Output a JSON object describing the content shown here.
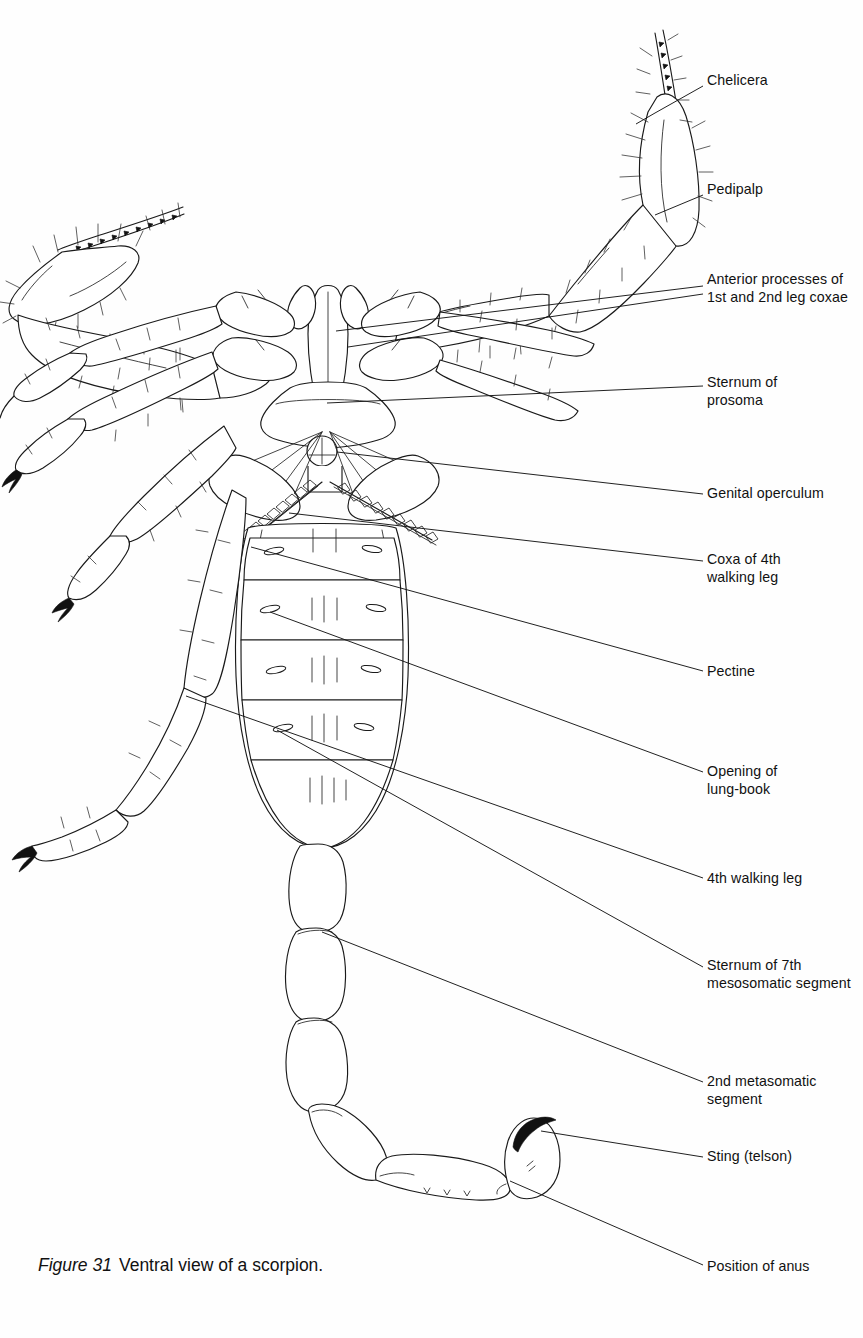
{
  "figure": {
    "caption_number": "Figure 31",
    "caption_text": "Ventral view of a scorpion.",
    "subject": "scorpion",
    "view": "ventral"
  },
  "labels": [
    {
      "id": "chelicera",
      "text": "Chelicera",
      "x": 707,
      "y": 72,
      "leader": [
        [
          703,
          86
        ],
        [
          655,
          113
        ]
      ]
    },
    {
      "id": "pedipalp",
      "text": "Pedipalp",
      "x": 707,
      "y": 181,
      "leader": [
        [
          703,
          195
        ],
        [
          660,
          213
        ]
      ]
    },
    {
      "id": "anterior-processes",
      "text": "Anterior processes of\n1st and 2nd leg coxae",
      "x": 707,
      "y": 271,
      "leader": [
        [
          703,
          287
        ],
        [
          330,
          330
        ]
      ]
    },
    {
      "id": "anterior-processes-2",
      "text": "",
      "x": 707,
      "y": 271,
      "leader": [
        [
          703,
          294
        ],
        [
          345,
          345
        ]
      ]
    },
    {
      "id": "sternum-prosoma",
      "text": "Sternum of\nprosoma",
      "x": 707,
      "y": 374,
      "leader": [
        [
          703,
          386
        ],
        [
          326,
          404
        ]
      ]
    },
    {
      "id": "genital-operculum",
      "text": "Genital operculum",
      "x": 707,
      "y": 485,
      "leader": [
        [
          703,
          495
        ],
        [
          336,
          452
        ]
      ]
    },
    {
      "id": "coxa-4th-leg",
      "text": "Coxa of 4th\nwalking leg",
      "x": 707,
      "y": 551,
      "leader": [
        [
          703,
          561
        ],
        [
          290,
          513
        ]
      ]
    },
    {
      "id": "pectine",
      "text": "Pectine",
      "x": 707,
      "y": 663,
      "leader": [
        [
          703,
          672
        ],
        [
          252,
          547
        ]
      ]
    },
    {
      "id": "opening-lung-book",
      "text": "Opening of\nlung-book",
      "x": 707,
      "y": 763,
      "leader": [
        [
          703,
          772
        ],
        [
          271,
          612
        ]
      ]
    },
    {
      "id": "4th-walking-leg",
      "text": "4th walking leg",
      "x": 707,
      "y": 870,
      "leader": [
        [
          703,
          878
        ],
        [
          186,
          696
        ]
      ]
    },
    {
      "id": "sternum-7th",
      "text": "Sternum of 7th\nmesosomatic segment",
      "x": 707,
      "y": 957,
      "leader": [
        [
          703,
          968
        ],
        [
          277,
          730
        ]
      ]
    },
    {
      "id": "2nd-metasomatic",
      "text": "2nd metasomatic\nsegment",
      "x": 707,
      "y": 1073,
      "leader": [
        [
          703,
          1083
        ],
        [
          322,
          932
        ]
      ]
    },
    {
      "id": "sting-telson",
      "text": "Sting (telson)",
      "x": 707,
      "y": 1148,
      "leader": [
        [
          703,
          1157
        ],
        [
          540,
          1131
        ]
      ]
    },
    {
      "id": "position-of-anus",
      "text": "Position of anus",
      "x": 707,
      "y": 1258,
      "leader": [
        [
          703,
          1266
        ],
        [
          511,
          1181
        ]
      ]
    }
  ],
  "anatomy": {
    "parts": [
      "chelicera",
      "pedipalp",
      "anterior processes of 1st and 2nd leg coxae",
      "sternum of prosoma",
      "genital operculum",
      "coxa of 4th walking leg",
      "pectine",
      "opening of lung-book",
      "4th walking leg",
      "sternum of 7th mesosomatic segment",
      "2nd metasomatic segment",
      "sting (telson)",
      "position of anus"
    ],
    "mesosoma_segment_count": 5,
    "metasoma_segment_count": 5,
    "walking_leg_pairs": 4
  },
  "colors": {
    "background": "#fefefe",
    "ink": "#1a1a1a",
    "label_text": "#111111",
    "leader_line": "#151515"
  }
}
